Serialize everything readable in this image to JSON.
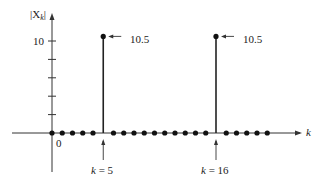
{
  "chart_data": {
    "type": "stem",
    "title": "",
    "xlabel": "k",
    "ylabel": "|X_k|",
    "ylabel_display": "|Xk|",
    "x": [
      0,
      1,
      2,
      3,
      4,
      5,
      6,
      7,
      8,
      9,
      10,
      11,
      12,
      13,
      14,
      15,
      16,
      17,
      18,
      19,
      20,
      21
    ],
    "values": [
      0,
      0,
      0,
      0,
      0,
      10.5,
      0,
      0,
      0,
      0,
      0,
      0,
      0,
      0,
      0,
      0,
      10.5,
      0,
      0,
      0,
      0,
      0
    ],
    "y_ticks": [
      2,
      4,
      6,
      8,
      10
    ],
    "y_tick_labels": [
      "",
      "",
      "",
      "",
      "10"
    ],
    "x_tick_labels": [
      "0"
    ],
    "ylim": [
      0,
      12
    ],
    "grid": false,
    "legend": null,
    "annotations": [
      {
        "text": "10.5",
        "x": 5,
        "y": 10.5,
        "type": "arrow-label"
      },
      {
        "text": "10.5",
        "x": 16,
        "y": 10.5,
        "type": "arrow-label"
      },
      {
        "text": "k = 5",
        "x": 5,
        "type": "arrow-below-axis"
      },
      {
        "text": "k = 16",
        "x": 16,
        "type": "arrow-below-axis"
      }
    ]
  },
  "labels": {
    "y_axis": "|X",
    "y_axis_sub": "k",
    "y_axis_close": "|",
    "x_axis": "k",
    "tick_10": "10",
    "origin": "0",
    "peak1": "10.5",
    "peak2": "10.5",
    "mark1_k": "k",
    "mark1_eq": " = 5",
    "mark2_k": "k",
    "mark2_eq": " = 16"
  }
}
